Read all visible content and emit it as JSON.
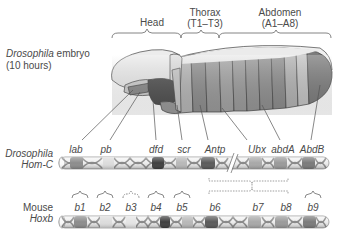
{
  "embryo": {
    "title_italic": "Drosophila",
    "title_rest": " embryo",
    "age": "(10 hours)"
  },
  "regions": [
    {
      "name": "Head",
      "sub": ""
    },
    {
      "name": "Thorax",
      "sub": "(T1–T3)"
    },
    {
      "name": "Abdomen",
      "sub": "(A1–A8)"
    }
  ],
  "drosophila_cluster": {
    "label_line1": "Drosophila",
    "label_line2": "Hom-C",
    "genes": [
      "lab",
      "pb",
      "dfd",
      "scr",
      "Antp",
      "Ubx",
      "abdA",
      "AbdB"
    ]
  },
  "mouse_cluster": {
    "label_line1": "Mouse",
    "label_line2": "Hoxb",
    "genes": [
      "b1",
      "b2",
      "b3",
      "b4",
      "b5",
      "b6",
      "b7",
      "b8",
      "b9"
    ]
  },
  "colors": {
    "lab": "#8c8c8c",
    "pb": "#d6d6d6",
    "dfd": "#3f3f3f",
    "scr": "#b8b8b8",
    "Antp": "#5a5a5a",
    "Ubx": "#a8a8a8",
    "abdA": "#9a9a9a",
    "AbdB": "#7a7a7a",
    "dna_strand": "#8a8a8a",
    "bar_fill": "#eeeeee",
    "outline": "#555555"
  }
}
